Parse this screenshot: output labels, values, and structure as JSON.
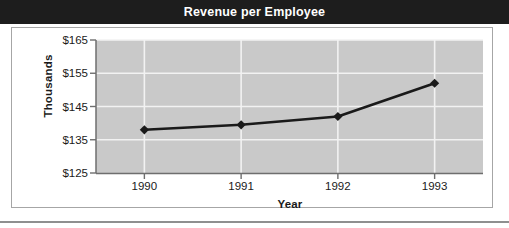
{
  "chart_data": {
    "type": "line",
    "title": "Revenue per Employee",
    "xlabel": "Year",
    "ylabel": "Thousands",
    "categories": [
      "1990",
      "1991",
      "1992",
      "1993"
    ],
    "x": [
      1990,
      1991,
      1992,
      1993
    ],
    "values": [
      138,
      139.5,
      142,
      152
    ],
    "series": [
      {
        "name": "Revenue per Employee",
        "values": [
          138,
          139.5,
          142,
          152
        ]
      }
    ],
    "ytick_labels": [
      "$165",
      "$155",
      "$145",
      "$135",
      "$125"
    ],
    "ytick_values": [
      165,
      155,
      145,
      135,
      125
    ],
    "ylim": [
      125,
      165
    ],
    "grid": "horizontal-and-vertical",
    "legend": "none",
    "marker": "diamond",
    "colors": {
      "title_band": "#1d1d1d",
      "title_text": "#ffffff",
      "plot_background": "#c9c9c9",
      "gridline": "#f2f2f2",
      "line": "#1a1a1a",
      "marker": "#1a1a1a",
      "axis": "#6e6e6e",
      "frame": "#a6a6a6",
      "tick_text": "#1a1a1a"
    }
  }
}
